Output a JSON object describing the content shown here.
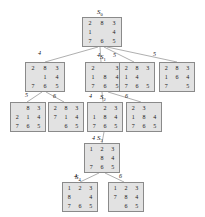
{
  "diagram": {
    "blank": "",
    "node_fill": "#e2e2e2",
    "node_stroke": "#8a8a8a",
    "edge_color": "#9a9a9a",
    "nodes": [
      {
        "id": "n0",
        "state_label": "S0",
        "state_label_base": "S",
        "state_label_sub": "0",
        "x": 82,
        "y": 17,
        "w": 40,
        "h": 30,
        "cells": [
          "2",
          "8",
          "3",
          "1",
          "",
          "4",
          "7",
          "6",
          "5"
        ]
      },
      {
        "id": "n1",
        "state_label": "",
        "state_label_base": "",
        "state_label_sub": "",
        "x": 25,
        "y": 62,
        "w": 40,
        "h": 30,
        "cells": [
          "2",
          "8",
          "3",
          "",
          "1",
          "4",
          "7",
          "6",
          "5"
        ]
      },
      {
        "id": "n2",
        "state_label": "S1",
        "state_label_base": "S",
        "state_label_sub": "1",
        "x": 85,
        "y": 62,
        "w": 40,
        "h": 30,
        "cells": [
          "2",
          "",
          "3",
          "1",
          "8",
          "4",
          "7",
          "6",
          "5"
        ]
      },
      {
        "id": "n3",
        "state_label": "",
        "state_label_base": "",
        "state_label_sub": "",
        "x": 119,
        "y": 62,
        "w": 36,
        "h": 30,
        "cells": [
          "2",
          "8",
          "3",
          "1",
          "4",
          "",
          "7",
          "6",
          "5"
        ]
      },
      {
        "id": "n4",
        "state_label": "",
        "state_label_base": "",
        "state_label_sub": "",
        "x": 159,
        "y": 62,
        "w": 36,
        "h": 30,
        "cells": [
          "2",
          "8",
          "3",
          "1",
          "6",
          "4",
          "7",
          "",
          "5"
        ]
      },
      {
        "id": "n5",
        "state_label": "",
        "state_label_base": "",
        "state_label_sub": "",
        "x": 10,
        "y": 102,
        "w": 36,
        "h": 30,
        "cells": [
          "",
          "8",
          "3",
          "2",
          "1",
          "4",
          "7",
          "6",
          "5"
        ]
      },
      {
        "id": "n6",
        "state_label": "",
        "state_label_base": "",
        "state_label_sub": "",
        "x": 48,
        "y": 102,
        "w": 36,
        "h": 30,
        "cells": [
          "2",
          "8",
          "3",
          "7",
          "1",
          "4",
          "",
          "6",
          "5"
        ]
      },
      {
        "id": "n7",
        "state_label": "S2",
        "state_label_base": "S",
        "state_label_sub": "2",
        "x": 87,
        "y": 102,
        "w": 36,
        "h": 30,
        "cells": [
          "",
          "2",
          "3",
          "1",
          "8",
          "4",
          "7",
          "6",
          "5"
        ]
      },
      {
        "id": "n8",
        "state_label": "",
        "state_label_base": "",
        "state_label_sub": "",
        "x": 126,
        "y": 102,
        "w": 36,
        "h": 30,
        "cells": [
          "2",
          "3",
          "",
          "1",
          "8",
          "4",
          "7",
          "6",
          "5"
        ]
      },
      {
        "id": "n9",
        "state_label": "S3",
        "state_label_base": "S",
        "state_label_sub": "3",
        "x": 84,
        "y": 143,
        "w": 36,
        "h": 30,
        "cells": [
          "1",
          "2",
          "3",
          "",
          "8",
          "4",
          "7",
          "6",
          "5"
        ]
      },
      {
        "id": "n10",
        "state_label": "S4",
        "state_label_base": "S",
        "state_label_sub": "4",
        "x": 62,
        "y": 182,
        "w": 36,
        "h": 30,
        "cells": [
          "1",
          "2",
          "3",
          "8",
          "",
          "4",
          "7",
          "6",
          "5"
        ]
      },
      {
        "id": "n11",
        "state_label": "",
        "state_label_base": "",
        "state_label_sub": "",
        "x": 108,
        "y": 182,
        "w": 36,
        "h": 30,
        "cells": [
          "1",
          "2",
          "3",
          "7",
          "8",
          "4",
          "",
          "6",
          "5"
        ]
      }
    ],
    "edges": [
      {
        "from": "n0",
        "to": "n1",
        "x1": 98,
        "y1": 47,
        "x2": 45,
        "y2": 62,
        "cost": "4",
        "lx": 38,
        "ly": 50
      },
      {
        "from": "n0",
        "to": "n2",
        "x1": 100,
        "y1": 47,
        "x2": 101,
        "y2": 62,
        "cost": "4",
        "lx": 97,
        "ly": 52
      },
      {
        "from": "n0",
        "to": "n3",
        "x1": 104,
        "y1": 47,
        "x2": 134,
        "y2": 62,
        "cost": "5",
        "lx": 113,
        "ly": 52
      },
      {
        "from": "n0",
        "to": "n4",
        "x1": 107,
        "y1": 47,
        "x2": 177,
        "y2": 62,
        "cost": "5",
        "lx": 153,
        "ly": 51
      },
      {
        "from": "n1",
        "to": "n5",
        "x1": 42,
        "y1": 92,
        "x2": 27,
        "y2": 102,
        "cost": "5",
        "lx": 25,
        "ly": 92
      },
      {
        "from": "n1",
        "to": "n6",
        "x1": 46,
        "y1": 92,
        "x2": 64,
        "y2": 102,
        "cost": "6",
        "lx": 53,
        "ly": 93
      },
      {
        "from": "n2",
        "to": "n7",
        "x1": 102,
        "y1": 92,
        "x2": 103,
        "y2": 102,
        "cost": "4",
        "lx": 89,
        "ly": 93
      },
      {
        "from": "n2",
        "to": "n8",
        "x1": 108,
        "y1": 92,
        "x2": 141,
        "y2": 102,
        "cost": "6",
        "lx": 125,
        "ly": 93
      },
      {
        "from": "n7",
        "to": "n9",
        "x1": 104,
        "y1": 132,
        "x2": 102,
        "y2": 143,
        "cost": "4",
        "lx": 92,
        "ly": 135
      },
      {
        "from": "n9",
        "to": "n10",
        "x1": 99,
        "y1": 173,
        "x2": 80,
        "y2": 182,
        "cost": "4",
        "lx": 74,
        "ly": 173
      },
      {
        "from": "n9",
        "to": "n11",
        "x1": 105,
        "y1": 173,
        "x2": 124,
        "y2": 182,
        "cost": "6",
        "lx": 119,
        "ly": 173
      }
    ]
  }
}
